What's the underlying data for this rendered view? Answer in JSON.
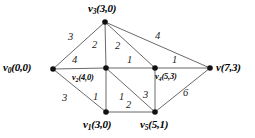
{
  "figure": {
    "kind": "weighted-graph-diagram",
    "background_color": "#ffffff",
    "edge_color": "#58585a",
    "vertex_color": "#111111"
  },
  "vertices": [
    {
      "id": "v0",
      "name": "v",
      "subscript": "0",
      "coords": "(0,0)",
      "text": "v",
      "sub": "0",
      "coord_text": "(0,0)",
      "x": 53,
      "y": 69,
      "label_x": 3,
      "label_y": 62,
      "size": "normal"
    },
    {
      "id": "v3",
      "name": "v",
      "subscript": "3",
      "coords": "(3,0)",
      "text": "v",
      "sub": "3",
      "coord_text": "(3,0)",
      "x": 105,
      "y": 22,
      "label_x": 88,
      "label_y": 3,
      "size": "normal"
    },
    {
      "id": "v2",
      "name": "v",
      "subscript": "2",
      "coords": "(4,0)",
      "text": "v",
      "sub": "2",
      "coord_text": "(4,0)",
      "x": 106,
      "y": 68,
      "label_x": 72,
      "label_y": 73,
      "size": "small"
    },
    {
      "id": "v4",
      "name": "v",
      "subscript": "4",
      "coords": "(5,3)",
      "text": "v",
      "sub": "4",
      "coord_text": "(5,3)",
      "x": 155,
      "y": 68,
      "label_x": 155,
      "label_y": 72,
      "size": "small"
    },
    {
      "id": "v",
      "name": "v",
      "subscript": "",
      "coords": "(7,3)",
      "text": "v",
      "sub": "",
      "coord_text": "(7,3)",
      "x": 210,
      "y": 68,
      "label_x": 216,
      "label_y": 62,
      "size": "normal"
    },
    {
      "id": "v1",
      "name": "v",
      "subscript": "1",
      "coords": "(3,0)",
      "text": "v",
      "sub": "1",
      "coord_text": "(3,0)",
      "x": 106,
      "y": 112,
      "label_x": 83,
      "label_y": 119,
      "size": "normal"
    },
    {
      "id": "v5",
      "name": "v",
      "subscript": "5",
      "coords": "(5,1)",
      "text": "v",
      "sub": "5",
      "coord_text": "(5,1)",
      "x": 155,
      "y": 112,
      "label_x": 140,
      "label_y": 119,
      "size": "normal"
    }
  ],
  "edges": [
    {
      "id": "e-v0-v3",
      "from": "v0",
      "to": "v3",
      "weight": "3",
      "x1": 53,
      "y1": 69,
      "x2": 105,
      "y2": 22,
      "label_x": 68,
      "label_y": 32
    },
    {
      "id": "e-v0-v2",
      "from": "v0",
      "to": "v2",
      "weight": "4",
      "x1": 53,
      "y1": 69,
      "x2": 106,
      "y2": 68,
      "label_x": 72,
      "label_y": 55
    },
    {
      "id": "e-v0-v1",
      "from": "v0",
      "to": "v1",
      "weight": "3",
      "x1": 53,
      "y1": 69,
      "x2": 106,
      "y2": 112,
      "label_x": 62,
      "label_y": 93
    },
    {
      "id": "e-v3-v2",
      "from": "v3",
      "to": "v2",
      "weight": "2",
      "x1": 105,
      "y1": 22,
      "x2": 106,
      "y2": 68,
      "label_x": 92,
      "label_y": 40
    },
    {
      "id": "e-v3-v4",
      "from": "v3",
      "to": "v4",
      "weight": "2",
      "x1": 105,
      "y1": 22,
      "x2": 155,
      "y2": 68,
      "label_x": 115,
      "label_y": 41
    },
    {
      "id": "e-v3-v",
      "from": "v3",
      "to": "v",
      "weight": "4",
      "x1": 105,
      "y1": 22,
      "x2": 210,
      "y2": 68,
      "label_x": 155,
      "label_y": 31
    },
    {
      "id": "e-v2-v4",
      "from": "v2",
      "to": "v4",
      "weight": "1",
      "x1": 106,
      "y1": 68,
      "x2": 155,
      "y2": 68,
      "label_x": 127,
      "label_y": 55
    },
    {
      "id": "e-v2-v1",
      "from": "v2",
      "to": "v1",
      "weight": "1",
      "x1": 106,
      "y1": 68,
      "x2": 106,
      "y2": 112,
      "label_x": 93,
      "label_y": 92
    },
    {
      "id": "e-v2-v5",
      "from": "v2",
      "to": "v5",
      "weight": "1",
      "x1": 106,
      "y1": 68,
      "x2": 155,
      "y2": 112,
      "label_x": 119,
      "label_y": 92
    },
    {
      "id": "e-v4-v",
      "from": "v4",
      "to": "v",
      "weight": "1",
      "x1": 155,
      "y1": 68,
      "x2": 210,
      "y2": 68,
      "label_x": 172,
      "label_y": 55
    },
    {
      "id": "e-v4-v5",
      "from": "v4",
      "to": "v5",
      "weight": "3",
      "x1": 155,
      "y1": 68,
      "x2": 155,
      "y2": 112,
      "label_x": 143,
      "label_y": 90
    },
    {
      "id": "e-v1-v5",
      "from": "v1",
      "to": "v5",
      "weight": "2",
      "x1": 106,
      "y1": 112,
      "x2": 155,
      "y2": 112,
      "label_x": 126,
      "label_y": 100
    },
    {
      "id": "e-v5-v",
      "from": "v5",
      "to": "v",
      "weight": "6",
      "x1": 155,
      "y1": 112,
      "x2": 210,
      "y2": 68,
      "label_x": 183,
      "label_y": 88
    }
  ],
  "chart_data": {
    "type": "diagram",
    "title": "",
    "nodes": [
      "v0 (0,0)",
      "v3 (3,0)",
      "v2 (4,0)",
      "v4 (5,3)",
      "v (7,3)",
      "v1 (3,0)",
      "v5 (5,1)"
    ],
    "edge_list": [
      [
        "v0",
        "v3",
        3
      ],
      [
        "v0",
        "v2",
        4
      ],
      [
        "v0",
        "v1",
        3
      ],
      [
        "v3",
        "v2",
        2
      ],
      [
        "v3",
        "v4",
        2
      ],
      [
        "v3",
        "v",
        4
      ],
      [
        "v2",
        "v4",
        1
      ],
      [
        "v2",
        "v1",
        1
      ],
      [
        "v2",
        "v5",
        1
      ],
      [
        "v4",
        "v",
        1
      ],
      [
        "v4",
        "v5",
        3
      ],
      [
        "v1",
        "v5",
        2
      ],
      [
        "v5",
        "v",
        6
      ]
    ]
  }
}
